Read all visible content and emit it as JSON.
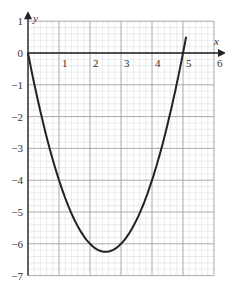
{
  "chart_data": {
    "type": "line",
    "title": "",
    "xlabel": "x",
    "ylabel": "y",
    "xlim": [
      0,
      6
    ],
    "ylim": [
      -7,
      1
    ],
    "grid": true,
    "minor_grid_per_unit": 5,
    "x_ticks": [
      "1",
      "2",
      "3",
      "4",
      "5",
      "6"
    ],
    "y_ticks": [
      "1",
      "0",
      "−1",
      "−2",
      "−3",
      "−4",
      "−5",
      "−6",
      "−7"
    ],
    "series": [
      {
        "name": "y = x² − 5x",
        "x": [
          0,
          0.5,
          1,
          1.5,
          2,
          2.5,
          3,
          3.5,
          4,
          4.5,
          5,
          5.1
        ],
        "y": [
          0,
          -2.25,
          -4,
          -5.25,
          -6,
          -6.25,
          -6,
          -5.25,
          -4,
          -2.25,
          0,
          0.51
        ]
      }
    ],
    "annotations": {
      "vertex": [
        2.5,
        -6.25
      ],
      "roots": [
        0,
        5
      ]
    }
  },
  "colors": {
    "grid_minor": "#d8d8d8",
    "grid_major": "#a0a0a0",
    "axis": "#222222",
    "curve": "#222222"
  }
}
